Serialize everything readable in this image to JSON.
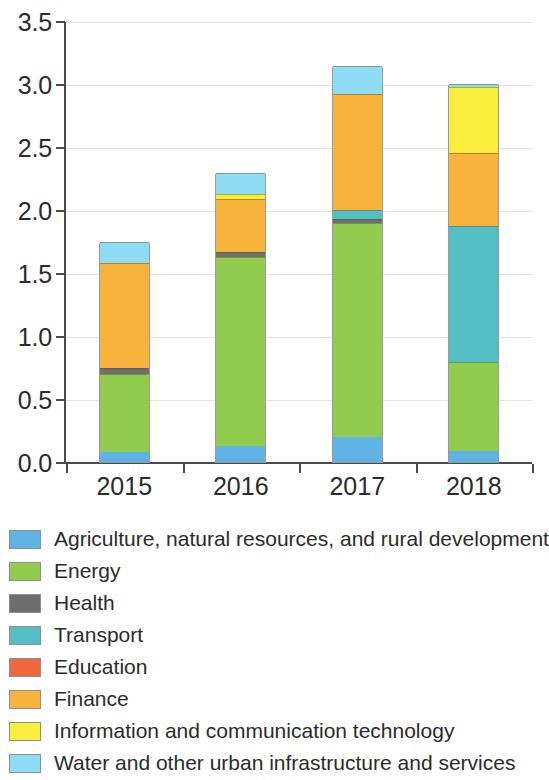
{
  "chart_data": {
    "type": "bar",
    "title": "",
    "subtitle": "",
    "xlabel": "",
    "ylabel": "",
    "stacked": true,
    "grid": true,
    "legend_position": "bottom",
    "ylim": [
      0.0,
      3.5
    ],
    "yticks": [
      "0.0",
      "0.5",
      "1.0",
      "1.5",
      "2.0",
      "2.5",
      "3.0",
      "3.5"
    ],
    "ytick_values": [
      0.0,
      0.5,
      1.0,
      1.5,
      2.0,
      2.5,
      3.0,
      3.5
    ],
    "categories": [
      "2015",
      "2016",
      "2017",
      "2018"
    ],
    "series": [
      {
        "name": "Agriculture, natural resources, and rural development",
        "color": "#5FB4E5",
        "values": [
          0.08,
          0.13,
          0.2,
          0.09
        ]
      },
      {
        "name": "Energy",
        "color": "#91CC4F",
        "values": [
          0.62,
          1.5,
          1.7,
          0.7
        ]
      },
      {
        "name": "Health",
        "color": "#6E6E6E",
        "values": [
          0.05,
          0.04,
          0.03,
          0.0
        ]
      },
      {
        "name": "Transport",
        "color": "#53BFC4",
        "values": [
          0.0,
          0.0,
          0.07,
          1.08
        ]
      },
      {
        "name": "Education",
        "color": "#F0693C",
        "values": [
          0.0,
          0.0,
          0.0,
          0.0
        ]
      },
      {
        "name": "Finance",
        "color": "#F8B33C",
        "values": [
          0.83,
          0.42,
          0.92,
          0.58
        ]
      },
      {
        "name": "Information and communication technology",
        "color": "#FAEE3C",
        "values": [
          0.0,
          0.04,
          0.0,
          0.53
        ]
      },
      {
        "name": "Water and other urban infrastructure and services",
        "color": "#8FDCF5",
        "values": [
          0.17,
          0.16,
          0.22,
          0.02
        ]
      }
    ],
    "totals": [
      1.75,
      2.29,
      3.14,
      3.0
    ]
  },
  "legend": {
    "items": [
      {
        "label": "Agriculture, natural resources, and rural development",
        "color": "#5FB4E5"
      },
      {
        "label": "Energy",
        "color": "#91CC4F"
      },
      {
        "label": "Health",
        "color": "#6E6E6E"
      },
      {
        "label": "Transport",
        "color": "#53BFC4"
      },
      {
        "label": "Education",
        "color": "#F0693C"
      },
      {
        "label": "Finance",
        "color": "#F8B33C"
      },
      {
        "label": "Information and communication technology",
        "color": "#FAEE3C"
      },
      {
        "label": "Water and other urban infrastructure and services",
        "color": "#8FDCF5"
      }
    ]
  }
}
